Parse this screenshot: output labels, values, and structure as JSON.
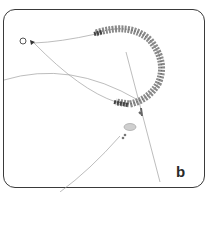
{
  "figure": {
    "label": "b",
    "colors": {
      "frame": "#3a3a3a",
      "beads": "#8a8a8a",
      "bead_dark": "#4a4a4a",
      "thread": "#9a9a9a",
      "background": "#ffffff"
    }
  }
}
